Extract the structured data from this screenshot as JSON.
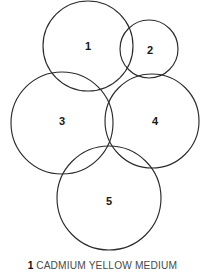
{
  "figure": {
    "type": "circle-swatch-diagram",
    "background_color": "#ffffff",
    "stroke_color": "#2b2b2b",
    "label_color": "#171717",
    "caption_color": "#4a4a4a",
    "width": 205,
    "height": 278
  },
  "circles": [
    {
      "label": "1",
      "cx": 88,
      "cy": 46,
      "r": 45,
      "label_x": 88,
      "label_y": 47
    },
    {
      "label": "2",
      "cx": 149,
      "cy": 49,
      "r": 29,
      "label_x": 150,
      "label_y": 51
    },
    {
      "label": "3",
      "cx": 62,
      "cy": 123,
      "r": 51,
      "label_x": 62,
      "label_y": 122
    },
    {
      "label": "4",
      "cx": 152,
      "cy": 121,
      "r": 47,
      "label_x": 155,
      "label_y": 122
    },
    {
      "label": "5",
      "cx": 109,
      "cy": 198,
      "r": 52,
      "label_x": 109,
      "label_y": 202
    }
  ],
  "caption": {
    "index": "1",
    "name": "CADMIUM YELLOW MEDIUM"
  }
}
